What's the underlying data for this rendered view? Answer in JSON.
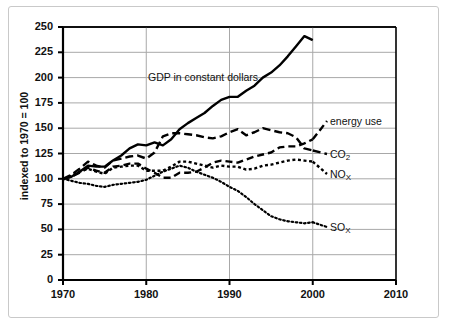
{
  "chart_data": {
    "type": "line",
    "title": "",
    "xlabel": "",
    "ylabel": "indexed to 1970 = 100",
    "xlim": [
      1970,
      2010
    ],
    "ylim": [
      0,
      250
    ],
    "xticks": [
      "1970",
      "1980",
      "1990",
      "2000",
      "2010"
    ],
    "yticks": [
      "0",
      "25",
      "50",
      "75",
      "100",
      "125",
      "150",
      "175",
      "200",
      "225",
      "250"
    ],
    "grid": true,
    "legend_position": "inline-right",
    "annotations": [
      {
        "text": "GDP in constant dollars",
        "x": 1981,
        "y": 210
      }
    ],
    "series": [
      {
        "name": "GDP in constant dollars",
        "label": "GDP in constant dollars",
        "style": "solid",
        "color": "#000000",
        "x": [
          1970,
          1971,
          1972,
          1973,
          1974,
          1975,
          1976,
          1977,
          1978,
          1979,
          1980,
          1981,
          1982,
          1983,
          1984,
          1985,
          1986,
          1987,
          1988,
          1989,
          1990,
          1991,
          1992,
          1993,
          1994,
          1995,
          1996,
          1997,
          1998,
          1999,
          2000
        ],
        "values": [
          100,
          102,
          107,
          113,
          112,
          112,
          118,
          123,
          130,
          134,
          133,
          136,
          133,
          139,
          149,
          155,
          160,
          165,
          172,
          178,
          181,
          181,
          187,
          192,
          200,
          205,
          212,
          221,
          231,
          241,
          237
        ]
      },
      {
        "name": "energy use",
        "label": "energy use",
        "style": "dashed",
        "color": "#000000",
        "x": [
          1970,
          1971,
          1972,
          1973,
          1974,
          1975,
          1976,
          1977,
          1978,
          1979,
          1980,
          1981,
          1982,
          1983,
          1984,
          1985,
          1986,
          1987,
          1988,
          1989,
          1990,
          1991,
          1992,
          1993,
          1994,
          1995,
          1996,
          1997,
          1998,
          1999,
          2000
        ],
        "values": [
          100,
          102,
          106,
          111,
          108,
          106,
          112,
          113,
          115,
          115,
          110,
          106,
          101,
          101,
          106,
          106,
          107,
          111,
          116,
          118,
          117,
          116,
          119,
          122,
          124,
          126,
          131,
          132,
          132,
          135,
          139
        ]
      },
      {
        "name": "CO2",
        "label": "CO₂",
        "label_base": "CO",
        "label_sub": "2",
        "style": "dashed-long",
        "color": "#000000",
        "x": [
          1970,
          1971,
          1972,
          1973,
          1974,
          1975,
          1976,
          1977,
          1978,
          1979,
          1980,
          1981,
          1982,
          1983,
          1984,
          1985,
          1986,
          1987,
          1988,
          1989,
          1990,
          1991,
          1992,
          1993,
          1994,
          1995,
          1996,
          1997,
          1998,
          1999,
          2000
        ],
        "values": [
          100,
          104,
          110,
          117,
          113,
          111,
          118,
          120,
          122,
          123,
          120,
          126,
          142,
          145,
          145,
          144,
          143,
          141,
          140,
          142,
          146,
          149,
          143,
          146,
          150,
          148,
          146,
          145,
          141,
          130,
          128
        ]
      },
      {
        "name": "NOx",
        "label": "NOₓ",
        "label_base": "NO",
        "label_sub": "X",
        "style": "dotted",
        "color": "#000000",
        "x": [
          1970,
          1971,
          1972,
          1973,
          1974,
          1975,
          1976,
          1977,
          1978,
          1979,
          1980,
          1981,
          1982,
          1983,
          1984,
          1985,
          1986,
          1987,
          1988,
          1989,
          1990,
          1991,
          1992,
          1993,
          1994,
          1995,
          1996,
          1997,
          1998,
          1999,
          2000
        ],
        "values": [
          100,
          103,
          107,
          110,
          107,
          105,
          111,
          112,
          113,
          113,
          108,
          108,
          108,
          112,
          117,
          117,
          115,
          113,
          111,
          113,
          112,
          112,
          109,
          110,
          113,
          114,
          116,
          118,
          119,
          118,
          117
        ]
      },
      {
        "name": "SOx",
        "label": "SOₓ",
        "label_base": "SO",
        "label_sub": "X",
        "style": "fine-dotted",
        "color": "#000000",
        "x": [
          1970,
          1971,
          1972,
          1973,
          1974,
          1975,
          1976,
          1977,
          1978,
          1979,
          1980,
          1981,
          1982,
          1983,
          1984,
          1985,
          1986,
          1987,
          1988,
          1989,
          1990,
          1991,
          1992,
          1993,
          1994,
          1995,
          1996,
          1997,
          1998,
          1999,
          2000
        ],
        "values": [
          100,
          98,
          96,
          95,
          93,
          92,
          94,
          95,
          96,
          97,
          99,
          103,
          107,
          110,
          113,
          111,
          107,
          104,
          101,
          97,
          92,
          88,
          82,
          75,
          69,
          63,
          60,
          58,
          57,
          56,
          57
        ]
      }
    ]
  },
  "axis": {
    "y_title": "indexed to 1970 = 100"
  },
  "labels": {
    "gdp": "GDP in constant dollars",
    "energy_use": "energy use",
    "co2_base": "CO",
    "co2_sub": "2",
    "nox_base": "NO",
    "nox_sub": "X",
    "sox_base": "SO",
    "sox_sub": "X"
  }
}
